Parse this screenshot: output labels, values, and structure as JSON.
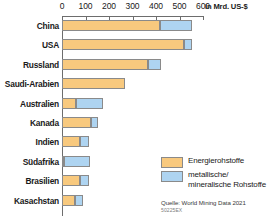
{
  "axis": {
    "unit_label": "in Mrd. US-$",
    "ticks": [
      0,
      100,
      200,
      300,
      400,
      500,
      600
    ]
  },
  "legend": {
    "items": [
      {
        "label": "Energierohstoffe",
        "color": "#f8c97e"
      },
      {
        "label": "metallische/\nmineralische Rohstoffe",
        "color": "#aed4f1"
      }
    ],
    "energy_label": "Energierohstoffe",
    "mineral_label_line1": "metallische/",
    "mineral_label_line2": "mineralische Rohstoffe"
  },
  "source": {
    "text": "Quelle: World Mining Data 2021",
    "code": "50225EX"
  },
  "chart_data": {
    "type": "bar",
    "orientation": "horizontal",
    "stacked": true,
    "title": "",
    "xlabel": "in Mrd. US-$",
    "ylabel": "",
    "xlim": [
      0,
      620
    ],
    "grid": false,
    "legend_position": "bottom-right",
    "categories": [
      "China",
      "USA",
      "Russland",
      "Saudi-Arabien",
      "Australien",
      "Kanada",
      "Indien",
      "Südafrika",
      "Brasilien",
      "Kasachstan"
    ],
    "series": [
      {
        "name": "Energierohstoffe",
        "color": "#f8c97e",
        "values": [
          415,
          520,
          365,
          270,
          60,
          125,
          75,
          10,
          75,
          55
        ]
      },
      {
        "name": "metallische/mineralische Rohstoffe",
        "color": "#aed4f1",
        "values": [
          140,
          35,
          55,
          0,
          115,
          30,
          40,
          110,
          40,
          35
        ]
      }
    ],
    "totals": [
      555,
      555,
      420,
      270,
      175,
      155,
      115,
      120,
      115,
      90
    ]
  }
}
